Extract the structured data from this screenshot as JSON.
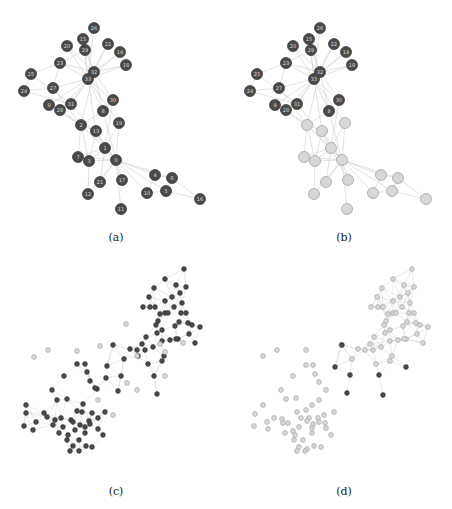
{
  "figure": {
    "captions": {
      "a": "(a)",
      "b": "(b)",
      "c": "(c)",
      "d": "(d)"
    },
    "colors": {
      "dark_node": "#4a4a4a",
      "dark_stroke": "#2e2e2e",
      "light_node": "#d8d8d8",
      "light_stroke": "#9a9a9a",
      "edge": "#cfcfcf"
    }
  },
  "karate": {
    "node_radius": 5.5,
    "nodes": [
      {
        "id": "26",
        "x": 94,
        "y": 28
      },
      {
        "id": "15",
        "x": 83,
        "y": 39
      },
      {
        "id": "20",
        "x": 67,
        "y": 46
      },
      {
        "id": "29",
        "x": 85,
        "y": 50
      },
      {
        "id": "22",
        "x": 108,
        "y": 44
      },
      {
        "id": "14",
        "x": 120,
        "y": 52
      },
      {
        "id": "18",
        "x": 126,
        "y": 65
      },
      {
        "id": "23",
        "x": 60,
        "y": 63
      },
      {
        "id": "25",
        "x": 31,
        "y": 74
      },
      {
        "id": "32",
        "x": 94,
        "y": 72
      },
      {
        "id": "33",
        "x": 88,
        "y": 79
      },
      {
        "id": "27",
        "x": 53,
        "y": 88
      },
      {
        "id": "24",
        "x": 24,
        "y": 91
      },
      {
        "id": "9",
        "x": 49,
        "y": 105
      },
      {
        "id": "28",
        "x": 60,
        "y": 110
      },
      {
        "id": "31",
        "x": 71,
        "y": 104
      },
      {
        "id": "30",
        "x": 113,
        "y": 100
      },
      {
        "id": "8",
        "x": 103,
        "y": 111
      },
      {
        "id": "2",
        "x": 81,
        "y": 125
      },
      {
        "id": "13",
        "x": 96,
        "y": 131
      },
      {
        "id": "19",
        "x": 119,
        "y": 123
      },
      {
        "id": "1",
        "x": 105,
        "y": 148
      },
      {
        "id": "7",
        "x": 78,
        "y": 157
      },
      {
        "id": "3",
        "x": 89,
        "y": 161
      },
      {
        "id": "0",
        "x": 116,
        "y": 160
      },
      {
        "id": "21",
        "x": 100,
        "y": 182
      },
      {
        "id": "17",
        "x": 122,
        "y": 180
      },
      {
        "id": "4",
        "x": 155,
        "y": 175
      },
      {
        "id": "6",
        "x": 172,
        "y": 178
      },
      {
        "id": "12",
        "x": 88,
        "y": 194
      },
      {
        "id": "10",
        "x": 147,
        "y": 193
      },
      {
        "id": "5",
        "x": 166,
        "y": 191
      },
      {
        "id": "16",
        "x": 200,
        "y": 199
      },
      {
        "id": "11",
        "x": 121,
        "y": 209
      }
    ],
    "edges": [
      [
        "0",
        "1"
      ],
      [
        "0",
        "2"
      ],
      [
        "0",
        "3"
      ],
      [
        "0",
        "4"
      ],
      [
        "0",
        "5"
      ],
      [
        "0",
        "6"
      ],
      [
        "0",
        "7"
      ],
      [
        "0",
        "8"
      ],
      [
        "0",
        "10"
      ],
      [
        "0",
        "11"
      ],
      [
        "0",
        "12"
      ],
      [
        "0",
        "13"
      ],
      [
        "0",
        "17"
      ],
      [
        "0",
        "19"
      ],
      [
        "0",
        "21"
      ],
      [
        "0",
        "31"
      ],
      [
        "1",
        "2"
      ],
      [
        "1",
        "3"
      ],
      [
        "1",
        "7"
      ],
      [
        "1",
        "13"
      ],
      [
        "1",
        "17"
      ],
      [
        "1",
        "19"
      ],
      [
        "1",
        "21"
      ],
      [
        "1",
        "30"
      ],
      [
        "2",
        "3"
      ],
      [
        "2",
        "7"
      ],
      [
        "2",
        "8"
      ],
      [
        "2",
        "9"
      ],
      [
        "2",
        "13"
      ],
      [
        "2",
        "27"
      ],
      [
        "2",
        "28"
      ],
      [
        "2",
        "32"
      ],
      [
        "3",
        "7"
      ],
      [
        "3",
        "12"
      ],
      [
        "3",
        "13"
      ],
      [
        "4",
        "6"
      ],
      [
        "4",
        "10"
      ],
      [
        "5",
        "6"
      ],
      [
        "5",
        "10"
      ],
      [
        "5",
        "16"
      ],
      [
        "6",
        "16"
      ],
      [
        "8",
        "30"
      ],
      [
        "8",
        "32"
      ],
      [
        "8",
        "33"
      ],
      [
        "9",
        "33"
      ],
      [
        "13",
        "33"
      ],
      [
        "14",
        "32"
      ],
      [
        "14",
        "33"
      ],
      [
        "15",
        "32"
      ],
      [
        "15",
        "33"
      ],
      [
        "18",
        "32"
      ],
      [
        "18",
        "33"
      ],
      [
        "19",
        "33"
      ],
      [
        "20",
        "32"
      ],
      [
        "20",
        "33"
      ],
      [
        "22",
        "32"
      ],
      [
        "22",
        "33"
      ],
      [
        "23",
        "25"
      ],
      [
        "23",
        "27"
      ],
      [
        "23",
        "29"
      ],
      [
        "23",
        "32"
      ],
      [
        "23",
        "33"
      ],
      [
        "24",
        "25"
      ],
      [
        "24",
        "27"
      ],
      [
        "24",
        "31"
      ],
      [
        "25",
        "31"
      ],
      [
        "26",
        "29"
      ],
      [
        "26",
        "33"
      ],
      [
        "27",
        "33"
      ],
      [
        "28",
        "31"
      ],
      [
        "28",
        "33"
      ],
      [
        "29",
        "32"
      ],
      [
        "29",
        "33"
      ],
      [
        "30",
        "32"
      ],
      [
        "30",
        "33"
      ],
      [
        "31",
        "32"
      ],
      [
        "31",
        "33"
      ],
      [
        "32",
        "33"
      ]
    ],
    "panel_b_light_ids": [
      "0",
      "1",
      "2",
      "3",
      "4",
      "5",
      "6",
      "7",
      "10",
      "11",
      "12",
      "13",
      "16",
      "17",
      "19",
      "21"
    ],
    "panel_b_dark_ids": [
      "8",
      "9",
      "14",
      "15",
      "18",
      "20",
      "22",
      "23",
      "24",
      "25",
      "26",
      "27",
      "28",
      "29",
      "30",
      "31",
      "32",
      "33"
    ]
  },
  "large": {
    "node_radius": 2.4,
    "panel_c_upper_cluster": [
      [
        184,
        269
      ],
      [
        165,
        279
      ],
      [
        176,
        285
      ],
      [
        154,
        288
      ],
      [
        180,
        293
      ],
      [
        172,
        297
      ],
      [
        186,
        287
      ],
      [
        182,
        303
      ],
      [
        149,
        297
      ],
      [
        155,
        307
      ],
      [
        165,
        301
      ],
      [
        174,
        307
      ],
      [
        181,
        313
      ],
      [
        165,
        313
      ],
      [
        160,
        314
      ],
      [
        158,
        321
      ],
      [
        168,
        313
      ],
      [
        156,
        325
      ],
      [
        175,
        326
      ],
      [
        186,
        313
      ],
      [
        143,
        307
      ],
      [
        150,
        307
      ],
      [
        162,
        330
      ],
      [
        179,
        322
      ],
      [
        188,
        323
      ],
      [
        192,
        325
      ],
      [
        200,
        327
      ],
      [
        170,
        340
      ],
      [
        157,
        333
      ],
      [
        146,
        337
      ],
      [
        142,
        344
      ],
      [
        178,
        339
      ],
      [
        162,
        341
      ],
      [
        189,
        334
      ],
      [
        195,
        343
      ],
      [
        153,
        347
      ],
      [
        145,
        350
      ],
      [
        137,
        350
      ],
      [
        130,
        349
      ],
      [
        124,
        359
      ],
      [
        148,
        364
      ],
      [
        113,
        345
      ],
      [
        164,
        356
      ],
      [
        162,
        361
      ],
      [
        176,
        339
      ]
    ],
    "panel_c_lower_cluster": [
      [
        77,
        364
      ],
      [
        85,
        364
      ],
      [
        87,
        372
      ],
      [
        64,
        376
      ],
      [
        90,
        381
      ],
      [
        97,
        389
      ],
      [
        52,
        390
      ],
      [
        57,
        400
      ],
      [
        67,
        399
      ],
      [
        26,
        405
      ],
      [
        83,
        404
      ],
      [
        82,
        412
      ],
      [
        44,
        413
      ],
      [
        92,
        413
      ],
      [
        77,
        411
      ],
      [
        61,
        418
      ],
      [
        71,
        420
      ],
      [
        105,
        412
      ],
      [
        26,
        413
      ],
      [
        47,
        417
      ],
      [
        55,
        420
      ],
      [
        73,
        422
      ],
      [
        80,
        425
      ],
      [
        89,
        421
      ],
      [
        98,
        418
      ],
      [
        24,
        426
      ],
      [
        36,
        422
      ],
      [
        33,
        430
      ],
      [
        53,
        425
      ],
      [
        63,
        427
      ],
      [
        75,
        430
      ],
      [
        85,
        427
      ],
      [
        90,
        424
      ],
      [
        59,
        433
      ],
      [
        68,
        435
      ],
      [
        85,
        433
      ],
      [
        98,
        429
      ],
      [
        103,
        435
      ],
      [
        67,
        440
      ],
      [
        79,
        440
      ],
      [
        86,
        446
      ],
      [
        73,
        446
      ],
      [
        92,
        447
      ],
      [
        79,
        451
      ],
      [
        70,
        451
      ]
    ],
    "panel_c_bridge": [
      [
        138,
        356
      ],
      [
        107,
        366
      ],
      [
        106,
        378
      ],
      [
        95,
        388
      ],
      [
        121,
        376
      ],
      [
        118,
        391
      ],
      [
        154,
        376
      ],
      [
        157,
        394
      ]
    ],
    "panel_c_light_nodes": [
      [
        126,
        324
      ],
      [
        34,
        357
      ],
      [
        48,
        350
      ],
      [
        77,
        351
      ],
      [
        100,
        346
      ],
      [
        137,
        356
      ],
      [
        160,
        344
      ],
      [
        165,
        352
      ],
      [
        183,
        343
      ],
      [
        127,
        383
      ],
      [
        137,
        390
      ],
      [
        98,
        400
      ],
      [
        113,
        415
      ],
      [
        165,
        376
      ]
    ],
    "panel_d_offset_x": 226,
    "panel_d_dark_nodes": [
      [
        116,
        345
      ],
      [
        109,
        367
      ],
      [
        124,
        375
      ],
      [
        153,
        375
      ],
      [
        180,
        367
      ],
      [
        121,
        393
      ],
      [
        157,
        395
      ]
    ],
    "panel_d_light_lower_extra": [
      [
        37,
        356
      ],
      [
        51,
        350
      ],
      [
        80,
        350
      ],
      [
        80,
        365
      ],
      [
        87,
        365
      ],
      [
        89,
        374
      ],
      [
        93,
        382
      ],
      [
        100,
        390
      ],
      [
        67,
        376
      ],
      [
        55,
        390
      ],
      [
        60,
        399
      ],
      [
        70,
        398
      ],
      [
        37,
        405
      ],
      [
        86,
        405
      ],
      [
        93,
        400
      ],
      [
        71,
        412
      ],
      [
        80,
        410
      ],
      [
        98,
        415
      ],
      [
        108,
        412
      ],
      [
        29,
        414
      ],
      [
        48,
        418
      ],
      [
        56,
        419
      ],
      [
        75,
        418
      ],
      [
        83,
        418
      ],
      [
        92,
        418
      ],
      [
        93,
        422
      ],
      [
        28,
        426
      ],
      [
        41,
        422
      ],
      [
        42,
        429
      ],
      [
        57,
        423
      ],
      [
        62,
        423
      ],
      [
        67,
        431
      ],
      [
        73,
        427
      ],
      [
        81,
        421
      ],
      [
        86,
        428
      ],
      [
        87,
        424
      ],
      [
        99,
        423
      ],
      [
        59,
        433
      ],
      [
        69,
        435
      ],
      [
        86,
        433
      ],
      [
        100,
        428
      ],
      [
        105,
        435
      ],
      [
        68,
        440
      ],
      [
        77,
        440
      ],
      [
        88,
        446
      ],
      [
        73,
        447
      ],
      [
        81,
        449
      ],
      [
        95,
        447
      ],
      [
        79,
        451
      ],
      [
        71,
        451
      ]
    ]
  }
}
